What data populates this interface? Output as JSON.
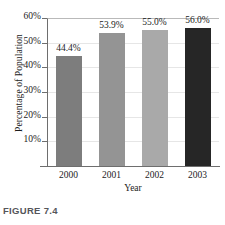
{
  "figure": {
    "caption": "FIGURE 7.4"
  },
  "chart_data": {
    "type": "bar",
    "title": "",
    "subtitle": "",
    "xlabel": "Year",
    "ylabel": "Percentage of Population",
    "categories": [
      "2000",
      "2001",
      "2002",
      "2003"
    ],
    "values": [
      44.4,
      53.9,
      55.0,
      56.0
    ],
    "data_labels": [
      "44.4%",
      "53.9%",
      "55.0%",
      "56.0%"
    ],
    "ylim": [
      0,
      60
    ],
    "y_ticks": [
      10,
      20,
      30,
      40,
      50,
      60
    ],
    "y_tick_labels": [
      "10%",
      "20%",
      "30%",
      "40%",
      "50%",
      "60%"
    ],
    "grid": true,
    "legend": null,
    "bar_colors": [
      "#7d7d7d",
      "#949494",
      "#a9a9a9",
      "#262626"
    ],
    "axis_color": "#6e6e6e",
    "grid_color": "#e6e6e6",
    "text_color": "#1c1c1c",
    "caption_color": "#55565a"
  }
}
